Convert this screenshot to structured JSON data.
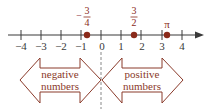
{
  "number_line": {
    "min_tick": -4,
    "max_tick": 4,
    "tick_labels": [
      "−4",
      "−3",
      "−2",
      "−1",
      "0",
      "1",
      "2",
      "3",
      "4"
    ],
    "line_color": "#3a3a3a",
    "point_color": "#8a2a1a"
  },
  "points": [
    {
      "value": -0.75,
      "label_sign": "−",
      "numerator": "3",
      "denominator": "4"
    },
    {
      "value": 1.5,
      "label_sign": "",
      "numerator": "3",
      "denominator": "2"
    },
    {
      "value": 3.14159,
      "label": "π"
    }
  ],
  "regions": {
    "negative": {
      "line1": "negative",
      "line2": "numbers"
    },
    "positive": {
      "line1": "positive",
      "line2": "numbers"
    }
  },
  "colors": {
    "arrow_outline": "#8a3a2a",
    "dashed_line": "#888888"
  }
}
